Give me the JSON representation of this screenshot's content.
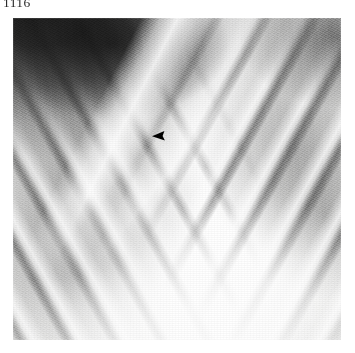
{
  "page": {
    "header_number": "1116",
    "background_color": "#ffffff"
  },
  "figure": {
    "name": "chest-radiograph",
    "modality_label": "radiograph",
    "view": "frontal chest radiograph",
    "plate": {
      "left": 13,
      "top": 18,
      "width": 328,
      "height": 322,
      "border_color": "#000000"
    },
    "tone": {
      "film_light": "#f4f4f2",
      "film_mid": "#dededd",
      "film_dark": "#bcbcbb",
      "deep_shadow": "#080808",
      "bone_highlight": "#ffffff"
    },
    "regions": [
      {
        "name": "supraclavicular-dark-region",
        "position": "upper-left",
        "tone": "very-dark"
      },
      {
        "name": "clavicle-band",
        "position": "upper-left-diagonal",
        "tone": "bright"
      },
      {
        "name": "mediastinum-spine-column",
        "position": "center-vertical",
        "tone": "bright"
      },
      {
        "name": "left-lung-field",
        "position": "left",
        "tone": "dark-with-bright-ribs"
      },
      {
        "name": "right-lung-field",
        "position": "right",
        "tone": "dark-with-bright-ribs"
      },
      {
        "name": "cardiac-silhouette",
        "position": "lower-center-right",
        "tone": "bright"
      },
      {
        "name": "posterior-ribs-left",
        "position": "left",
        "tone": "bright-bands"
      },
      {
        "name": "posterior-ribs-right",
        "position": "right",
        "tone": "bright-bands"
      }
    ]
  },
  "annotation": {
    "marker_type": "arrowhead",
    "marker_color": "#000000",
    "direction": "points-left",
    "x": 139,
    "y": 113,
    "width": 13,
    "height": 10
  }
}
